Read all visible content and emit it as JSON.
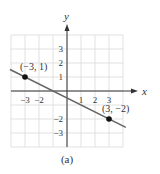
{
  "chart_data": {
    "type": "line",
    "title": "",
    "caption": "(a)",
    "xlabel": "x",
    "ylabel": "y",
    "xlim": [
      -4,
      4
    ],
    "ylim": [
      -4,
      4
    ],
    "grid": true,
    "x_tick_labels": [
      {
        "value": -3,
        "label": "−3"
      },
      {
        "value": -2,
        "label": "−2"
      },
      {
        "value": 1,
        "label": "1"
      },
      {
        "value": 2,
        "label": "2"
      },
      {
        "value": 3,
        "label": "3"
      }
    ],
    "y_tick_labels": [
      {
        "value": 3,
        "label": "3"
      },
      {
        "value": 2,
        "label": "2"
      },
      {
        "value": 1,
        "label": "1"
      },
      {
        "value": -2,
        "label": "−2"
      },
      {
        "value": -3,
        "label": "−3"
      }
    ],
    "points": [
      {
        "x": -3,
        "y": 1,
        "label": "(−3, 1)"
      },
      {
        "x": 3,
        "y": -2,
        "label": "(3, −2)"
      }
    ],
    "line": {
      "slope": -0.5,
      "intercept": -0.5,
      "x_start": -4,
      "x_end": 4.2
    },
    "colors": {
      "grid": "#d9d9d9",
      "axis": "#333333",
      "line": "#666666",
      "point": "#111111"
    }
  }
}
